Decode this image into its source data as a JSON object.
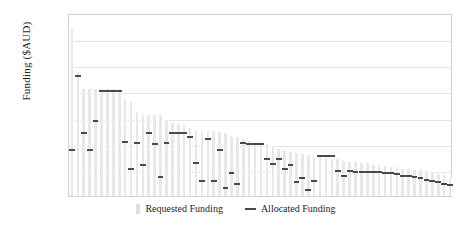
{
  "chart_data": {
    "type": "bar",
    "title": "",
    "xlabel": "",
    "ylabel": "Funding ($AUD)",
    "ylim": [
      0,
      140000
    ],
    "grid": true,
    "legend_position": "bottom-center",
    "ytick_labels": [
      "20,000",
      "40,000",
      "60,000",
      "80,000",
      "100,000",
      "120,000"
    ],
    "ytick_values": [
      20000,
      40000,
      60000,
      80000,
      100000,
      120000
    ],
    "categories": [
      "1",
      "2",
      "3",
      "4",
      "5",
      "6",
      "7",
      "8",
      "9",
      "10",
      "11",
      "12",
      "13",
      "14",
      "15",
      "16",
      "17",
      "18",
      "19",
      "20",
      "21",
      "22",
      "23",
      "24",
      "25",
      "26",
      "27",
      "28",
      "29",
      "30",
      "31",
      "32",
      "33",
      "34",
      "35",
      "36",
      "37",
      "38",
      "39",
      "40",
      "41",
      "42",
      "43",
      "44",
      "45",
      "46",
      "47",
      "48",
      "49",
      "50",
      "51",
      "52",
      "53",
      "54",
      "55",
      "56",
      "57",
      "58",
      "59",
      "60",
      "61",
      "62",
      "63",
      "64",
      "65"
    ],
    "series": [
      {
        "name": "Requested Funding",
        "type": "bar",
        "color": "#e8e8e8",
        "values": [
          128000,
          95000,
          82000,
          82000,
          82000,
          82000,
          82000,
          82000,
          82000,
          74000,
          72000,
          64000,
          62000,
          62000,
          62000,
          62000,
          58000,
          56000,
          55000,
          54000,
          52000,
          50000,
          50000,
          50000,
          50000,
          49000,
          48000,
          46000,
          45000,
          44000,
          42000,
          40000,
          40000,
          40000,
          38000,
          36000,
          35000,
          34000,
          33000,
          32000,
          31000,
          30000,
          30000,
          29000,
          28000,
          28000,
          27000,
          26000,
          26000,
          25000,
          25000,
          24000,
          24000,
          23000,
          22000,
          22000,
          21000,
          21000,
          20000,
          20000,
          19000,
          18000,
          17000,
          16000,
          14000
        ]
      },
      {
        "name": "Allocated Funding",
        "type": "marker",
        "color": "#4a4a4a",
        "values": [
          37000,
          93000,
          50000,
          37000,
          59000,
          82000,
          82000,
          82000,
          82000,
          43000,
          22000,
          42000,
          25000,
          50000,
          41000,
          16000,
          42000,
          50000,
          50000,
          50000,
          47000,
          27000,
          13000,
          45000,
          13000,
          37000,
          8000,
          19000,
          11000,
          42000,
          41000,
          41000,
          41000,
          30000,
          26000,
          30000,
          22000,
          25000,
          12000,
          15000,
          6000,
          13000,
          32000,
          32000,
          32000,
          21000,
          17000,
          21000,
          20000,
          20000,
          20000,
          20000,
          20000,
          19000,
          19000,
          18000,
          17000,
          17000,
          16000,
          15000,
          14000,
          13000,
          12000,
          11000,
          10000
        ]
      }
    ]
  },
  "legend": {
    "requested_label": "Requested Funding",
    "allocated_label": "Allocated Funding"
  }
}
